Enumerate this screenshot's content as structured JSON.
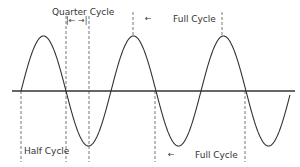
{
  "diagram": {
    "colors": {
      "background": "#ffffff",
      "wave": "#333333",
      "axis": "#333333",
      "dash": "#666666",
      "text": "#333333"
    },
    "axis": {
      "y": 91,
      "x_start": 12,
      "x_end": 295
    },
    "wave": {
      "amplitude_px": 55,
      "period_px": 90,
      "start_x": 21,
      "end_x": 290,
      "zero_crossings_x": [
        21,
        66,
        111,
        156,
        200,
        245,
        290
      ],
      "peaks_x": [
        43,
        133,
        222
      ],
      "troughs_x": [
        88,
        178,
        268
      ]
    },
    "labels": {
      "quarter_cycle": "Quarter Cycle",
      "quarter_arrows": "|←  →|",
      "full_cycle_top": "Full Cycle",
      "full_cycle_top_arrow": "←",
      "half_cycle": "Half Cycle",
      "full_cycle_bottom": "Full Cycle",
      "full_cycle_bottom_arrow": "←"
    },
    "dashed_lines": [
      {
        "name": "half-cycle-left-marker",
        "x": 21,
        "y1": 91,
        "y2": 162
      },
      {
        "name": "quarter-cycle-left-marker",
        "x": 66,
        "y1": 16,
        "y2": 162
      },
      {
        "name": "quarter-cycle-right-marker",
        "x": 89,
        "y1": 16,
        "y2": 162
      },
      {
        "name": "full-cycle-top-left-marker",
        "x": 133,
        "y1": 12,
        "y2": 36
      },
      {
        "name": "full-cycle-top-right-marker",
        "x": 222,
        "y1": 12,
        "y2": 36
      },
      {
        "name": "full-cycle-bottom-left-marker",
        "x": 155,
        "y1": 91,
        "y2": 162
      },
      {
        "name": "full-cycle-bottom-right-marker",
        "x": 245,
        "y1": 91,
        "y2": 162
      }
    ]
  }
}
